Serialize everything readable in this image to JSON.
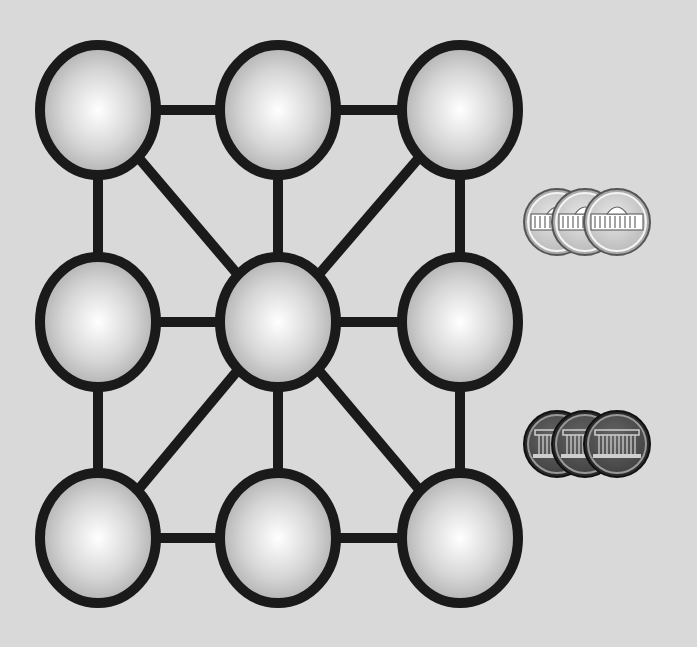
{
  "board": {
    "background": "#d9d9d9",
    "nodes": [
      {
        "id": "n00",
        "x": 98,
        "y": 110
      },
      {
        "id": "n01",
        "x": 278,
        "y": 110
      },
      {
        "id": "n02",
        "x": 460,
        "y": 110
      },
      {
        "id": "n10",
        "x": 98,
        "y": 322
      },
      {
        "id": "n11",
        "x": 278,
        "y": 322
      },
      {
        "id": "n12",
        "x": 460,
        "y": 322
      },
      {
        "id": "n20",
        "x": 98,
        "y": 538
      },
      {
        "id": "n21",
        "x": 278,
        "y": 538
      },
      {
        "id": "n22",
        "x": 460,
        "y": 538
      }
    ],
    "edges": [
      [
        "n00",
        "n01"
      ],
      [
        "n01",
        "n02"
      ],
      [
        "n10",
        "n11"
      ],
      [
        "n11",
        "n12"
      ],
      [
        "n20",
        "n21"
      ],
      [
        "n21",
        "n22"
      ],
      [
        "n00",
        "n10"
      ],
      [
        "n10",
        "n20"
      ],
      [
        "n01",
        "n11"
      ],
      [
        "n11",
        "n21"
      ],
      [
        "n02",
        "n12"
      ],
      [
        "n12",
        "n22"
      ],
      [
        "n00",
        "n11"
      ],
      [
        "n02",
        "n11"
      ],
      [
        "n20",
        "n11"
      ],
      [
        "n22",
        "n11"
      ]
    ],
    "node_rx": 58,
    "node_ry": 65
  },
  "pieces": {
    "light": {
      "name": "light-tokens",
      "count": 3,
      "x": [
        557,
        585,
        617
      ],
      "y": 222,
      "fill": "#d0d0d0",
      "icon": "palace-icon"
    },
    "dark": {
      "name": "dark-tokens",
      "count": 3,
      "x": [
        557,
        585,
        617
      ],
      "y": 444,
      "fill": "#555555",
      "icon": "temple-icon"
    }
  }
}
